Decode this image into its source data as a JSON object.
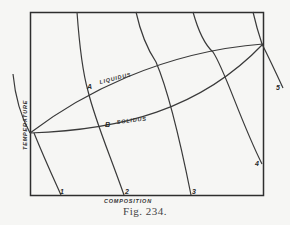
{
  "figure": {
    "caption": "Fig. 234.",
    "x_axis_label": "COMPOSITION",
    "y_axis_label": "TEMPERATURE",
    "curves": {
      "liquidus_label": "LIQUIDUS",
      "solidus_label": "SOLIDUS"
    },
    "points": {
      "a": "A",
      "b": "B"
    },
    "isotherm_labels": [
      "1",
      "2",
      "3",
      "4",
      "5"
    ]
  }
}
